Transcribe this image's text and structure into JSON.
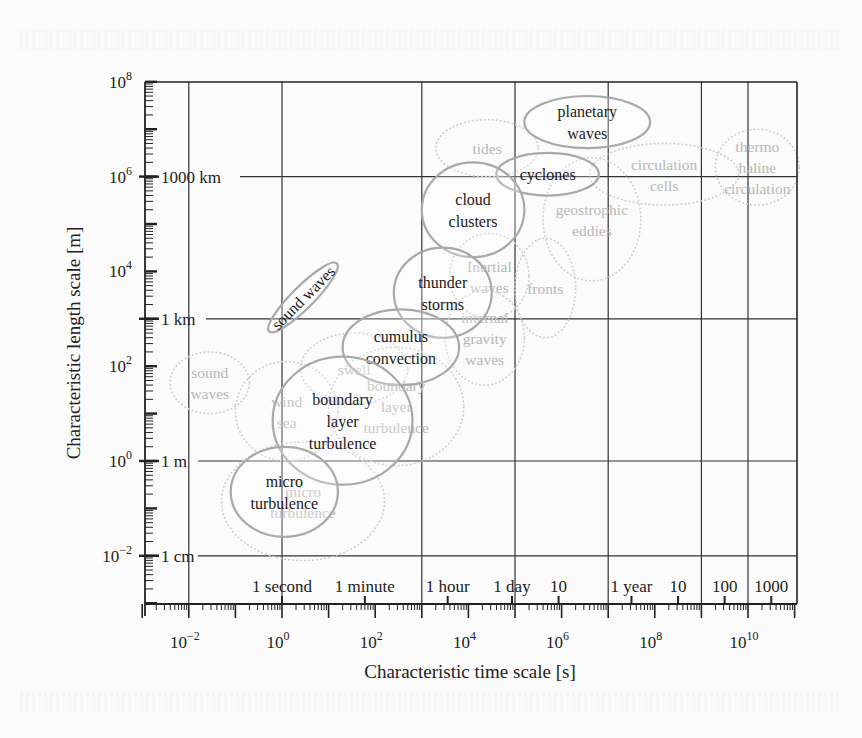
{
  "chart_data": {
    "type": "scatter",
    "subtype": "log-log ellipse diagram",
    "xlabel": "Characteristic time scale [s]",
    "ylabel": "Characteristic length scale [m]",
    "xscale": "log",
    "yscale": "log",
    "xlim_log10": [
      -3,
      11.2
    ],
    "ylim_log10": [
      -3,
      8
    ],
    "grid": true,
    "x_major_ticks": [
      {
        "exp": -2,
        "label": "10",
        "sup": "−2"
      },
      {
        "exp": 0,
        "label": "10",
        "sup": "0"
      },
      {
        "exp": 2,
        "label": "10",
        "sup": "2"
      },
      {
        "exp": 4,
        "label": "10",
        "sup": "4"
      },
      {
        "exp": 6,
        "label": "10",
        "sup": "6"
      },
      {
        "exp": 8,
        "label": "10",
        "sup": "8"
      },
      {
        "exp": 10,
        "label": "10",
        "sup": "10"
      }
    ],
    "x_named_ticks": [
      {
        "log10": 0,
        "label": "1 second"
      },
      {
        "log10": 1.778,
        "label": "1 minute"
      },
      {
        "log10": 3.556,
        "label": "1 hour"
      },
      {
        "log10": 4.936,
        "label": "1 day"
      },
      {
        "log10": 5.936,
        "label": "10"
      },
      {
        "log10": 7.499,
        "label": "1 year"
      },
      {
        "log10": 8.499,
        "label": "10"
      },
      {
        "log10": 9.499,
        "label": "100"
      },
      {
        "log10": 10.499,
        "label": "1000"
      }
    ],
    "y_major_ticks": [
      {
        "exp": 8,
        "label": "10",
        "sup": "8"
      },
      {
        "exp": 6,
        "label": "10",
        "sup": "6"
      },
      {
        "exp": 4,
        "label": "10",
        "sup": "4"
      },
      {
        "exp": 2,
        "label": "10",
        "sup": "2"
      },
      {
        "exp": 0,
        "label": "10",
        "sup": "0"
      },
      {
        "exp": -2,
        "label": "10",
        "sup": "−2"
      }
    ],
    "y_named_ticks": [
      {
        "log10": 6,
        "label": "1000 km"
      },
      {
        "log10": 3,
        "label": "1 km"
      },
      {
        "log10": 0,
        "label": "1 m"
      },
      {
        "log10": -2,
        "label": "1 cm"
      }
    ],
    "grid_x_log10": [
      -2,
      0,
      3,
      5,
      7,
      9,
      10
    ],
    "grid_y_log10": [
      6,
      3,
      0,
      -2
    ],
    "series": [
      {
        "name": "atmosphere",
        "style": "solid",
        "phenomena": [
          {
            "label": [
              "planetary",
              "waves"
            ],
            "x_log10": [
              5.2,
              7.9
            ],
            "y_log10": [
              6.6,
              7.7
            ],
            "rotate": 0
          },
          {
            "label": [
              "cyclones"
            ],
            "x_log10": [
              4.6,
              6.8
            ],
            "y_log10": [
              5.6,
              6.5
            ],
            "rotate": 0
          },
          {
            "label": [
              "cloud",
              "clusters"
            ],
            "x_log10": [
              3.0,
              5.2
            ],
            "y_log10": [
              4.3,
              6.3
            ],
            "rotate": 0
          },
          {
            "label": [
              "thunder",
              "storms"
            ],
            "x_log10": [
              2.4,
              4.5
            ],
            "y_log10": [
              2.6,
              4.5
            ],
            "rotate": 0
          },
          {
            "label": [
              "cumulus",
              "convection"
            ],
            "x_log10": [
              1.3,
              3.8
            ],
            "y_log10": [
              1.6,
              3.2
            ],
            "rotate": 0
          },
          {
            "label": [
              "sound waves"
            ],
            "x_log10": [
              -0.5,
              1.4
            ],
            "y_log10": [
              2.4,
              4.5
            ],
            "rotate": -45
          },
          {
            "label": [
              "boundary",
              "layer",
              "turbulence"
            ],
            "x_log10": [
              -0.2,
              2.8
            ],
            "y_log10": [
              -0.5,
              2.2
            ],
            "rotate": 0
          },
          {
            "label": [
              "micro",
              "turbulence"
            ],
            "x_log10": [
              -1.1,
              1.2
            ],
            "y_log10": [
              -1.6,
              0.3
            ],
            "rotate": 0
          }
        ]
      },
      {
        "name": "ocean",
        "style": "dotted",
        "phenomena": [
          {
            "label": [
              "tides"
            ],
            "x_log10": [
              3.3,
              5.5
            ],
            "y_log10": [
              6.0,
              7.2
            ],
            "rotate": 0
          },
          {
            "label": [
              "circulation",
              "cells"
            ],
            "x_log10": [
              6.6,
              9.8
            ],
            "y_log10": [
              5.4,
              6.7
            ],
            "rotate": 0
          },
          {
            "label": [
              "thermo",
              "haline",
              "circulation"
            ],
            "x_log10": [
              9.3,
              11.1
            ],
            "y_log10": [
              5.4,
              7.0
            ],
            "rotate": 0
          },
          {
            "label": [
              "geostrophic",
              "eddies"
            ],
            "x_log10": [
              5.6,
              7.7
            ],
            "y_log10": [
              3.8,
              6.4
            ],
            "rotate": 0
          },
          {
            "label": [
              "fronts"
            ],
            "x_log10": [
              5.0,
              6.3
            ],
            "y_log10": [
              2.6,
              4.7
            ],
            "rotate": 0
          },
          {
            "label": [
              "Inertial",
              "waves"
            ],
            "x_log10": [
              3.6,
              5.3
            ],
            "y_log10": [
              3.0,
              4.8
            ],
            "rotate": 0
          },
          {
            "label": [
              "internal",
              "gravity",
              "waves"
            ],
            "x_log10": [
              3.5,
              5.2
            ],
            "y_log10": [
              1.6,
              3.6
            ],
            "rotate": 0
          },
          {
            "label": [
              "swell"
            ],
            "x_log10": [
              0.4,
              2.7
            ],
            "y_log10": [
              1.2,
              2.7
            ],
            "rotate": 0
          },
          {
            "label": [
              "sound",
              "waves"
            ],
            "x_log10": [
              -2.4,
              -0.7
            ],
            "y_log10": [
              1.0,
              2.3
            ],
            "rotate": 0
          },
          {
            "label": [
              "wind",
              "sea"
            ],
            "x_log10": [
              -1.0,
              1.2
            ],
            "y_log10": [
              0.0,
              2.1
            ],
            "rotate": 0
          },
          {
            "label": [
              "boundary",
              "layer",
              "turbulence"
            ],
            "x_log10": [
              1.0,
              3.9
            ],
            "y_log10": [
              -0.1,
              2.4
            ],
            "rotate": 0
          },
          {
            "label": [
              "micro",
              "turbulence"
            ],
            "x_log10": [
              -1.3,
              2.2
            ],
            "y_log10": [
              -2.1,
              0.4
            ],
            "rotate": 0
          }
        ]
      }
    ]
  }
}
